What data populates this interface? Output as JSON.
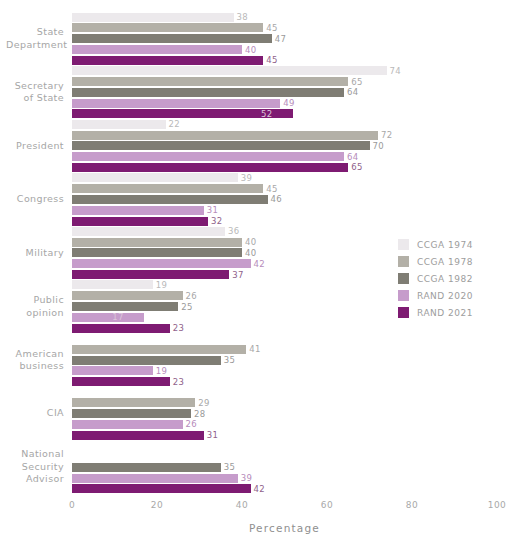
{
  "chart_data": {
    "type": "bar",
    "orientation": "horizontal",
    "title": "",
    "xlabel": "Percentage",
    "ylabel": "",
    "xlim": [
      0,
      100
    ],
    "xticks": [
      0,
      20,
      40,
      60,
      80,
      100
    ],
    "grid": false,
    "legend_position": "right",
    "categories": [
      "State\nDepartment",
      "Secretary\nof State",
      "President",
      "Congress",
      "Military",
      "Public\nopinion",
      "American\nbusiness",
      "CIA",
      "National\nSecurity\nAdvisor"
    ],
    "series": [
      {
        "name": "CCGA 1974",
        "color": "#ece9ec",
        "values": [
          38,
          74,
          22,
          39,
          36,
          19,
          null,
          null,
          null
        ]
      },
      {
        "name": "CCGA 1978",
        "color": "#b3b0a7",
        "values": [
          45,
          65,
          72,
          45,
          40,
          26,
          41,
          29,
          null
        ]
      },
      {
        "name": "CCGA 1982",
        "color": "#7f7d74",
        "values": [
          47,
          64,
          70,
          46,
          40,
          25,
          35,
          28,
          35
        ]
      },
      {
        "name": "RAND 2020",
        "color": "#c69ccb",
        "values": [
          40,
          49,
          64,
          31,
          42,
          17,
          19,
          26,
          39
        ]
      },
      {
        "name": "RAND 2021",
        "color": "#7e1b72",
        "values": [
          45,
          52,
          65,
          32,
          37,
          23,
          23,
          31,
          42
        ]
      }
    ],
    "label_colors": {
      "CCGA 1974": "#b9b9b9",
      "CCGA 1978": "#a8a8a8",
      "CCGA 1982": "#9a9a9a",
      "RAND 2020": "#b68cbb",
      "RAND 2021": "#8f5f8b"
    },
    "inside_label_groups": [
      {
        "category_index": 1,
        "series_index": 4
      },
      {
        "category_index": 5,
        "series_index": 3
      }
    ]
  },
  "axis": {
    "xlabel": "Percentage",
    "tick_labels": [
      "0",
      "20",
      "40",
      "60",
      "80",
      "100"
    ]
  },
  "legend": {
    "items": [
      {
        "label": "CCGA 1974",
        "color": "#ece9ec"
      },
      {
        "label": "CCGA 1978",
        "color": "#b3b0a7"
      },
      {
        "label": "CCGA 1982",
        "color": "#7f7d74"
      },
      {
        "label": "RAND 2020",
        "color": "#c69ccb"
      },
      {
        "label": "RAND 2021",
        "color": "#7e1b72"
      }
    ]
  }
}
